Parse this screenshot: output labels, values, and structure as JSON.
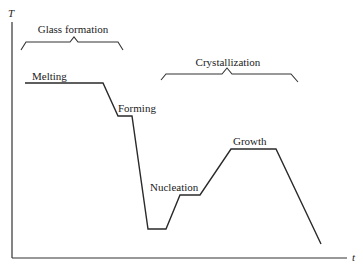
{
  "diagram": {
    "type": "temperature-time schedule",
    "axes": {
      "y_label": "T",
      "x_label": "t"
    },
    "brackets": [
      {
        "label": "Glass formation"
      },
      {
        "label": "Crystallization"
      }
    ],
    "stages": [
      {
        "label": "Melting"
      },
      {
        "label": "Forming"
      },
      {
        "label": "Nucleation"
      },
      {
        "label": "Growth"
      }
    ],
    "colors": {
      "line": "#2a2a2a",
      "background": "#ffffff"
    }
  }
}
